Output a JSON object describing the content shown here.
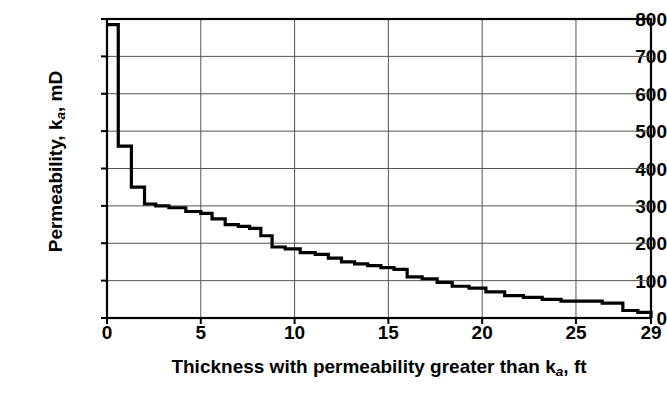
{
  "chart_data": {
    "type": "line",
    "subtype": "step-post",
    "title": "",
    "xlabel": "Thickness with permeability greater than k_a, ft",
    "xlabel_parts": {
      "pre": "Thickness with permeability greater than k",
      "sub": "a",
      "post": ", ft"
    },
    "ylabel": "Permeability, k_a, mD",
    "ylabel_parts": {
      "pre": "Permeability, k",
      "sub": "a",
      "post": ", mD"
    },
    "xlim": [
      0,
      29
    ],
    "ylim": [
      0,
      800
    ],
    "xticks": [
      0,
      5,
      10,
      15,
      20,
      25,
      29
    ],
    "xticklabels": [
      "0",
      "5",
      "10",
      "15",
      "20",
      "25",
      "29"
    ],
    "yticks": [
      0,
      100,
      200,
      300,
      400,
      500,
      600,
      700,
      800
    ],
    "yticklabels": [
      "0",
      "100",
      "200",
      "300",
      "400",
      "500",
      "600",
      "700",
      "800"
    ],
    "grid": true,
    "grid_x_at": [
      5,
      10,
      15,
      20,
      25
    ],
    "grid_y_at": [
      100,
      200,
      300,
      400,
      500,
      600,
      700
    ],
    "legend": null,
    "line_color": "#000000",
    "line_width": 3.2,
    "axis_color": "#000000",
    "grid_color": "#555555",
    "background": "#ffffff",
    "x": [
      0.0,
      0.6,
      1.3,
      2.0,
      2.6,
      3.3,
      4.2,
      5.0,
      5.6,
      6.3,
      7.0,
      7.6,
      8.2,
      8.8,
      9.5,
      10.3,
      11.1,
      11.8,
      12.5,
      13.2,
      13.9,
      14.6,
      15.3,
      16.0,
      16.8,
      17.6,
      18.4,
      19.3,
      20.2,
      21.2,
      22.2,
      23.2,
      24.2,
      25.3,
      26.4,
      27.5,
      28.3,
      29.0
    ],
    "y": [
      785,
      460,
      350,
      305,
      300,
      295,
      285,
      280,
      265,
      250,
      245,
      240,
      220,
      190,
      185,
      175,
      170,
      160,
      150,
      145,
      140,
      135,
      130,
      110,
      105,
      95,
      85,
      80,
      70,
      60,
      55,
      50,
      45,
      45,
      40,
      20,
      15,
      0
    ],
    "steps": [
      {
        "x_start": 0.0,
        "x_end": 0.6,
        "k": 785
      },
      {
        "x_start": 0.6,
        "x_end": 1.3,
        "k": 460
      },
      {
        "x_start": 1.3,
        "x_end": 2.0,
        "k": 350
      },
      {
        "x_start": 2.0,
        "x_end": 2.6,
        "k": 305
      },
      {
        "x_start": 2.6,
        "x_end": 3.3,
        "k": 300
      },
      {
        "x_start": 3.3,
        "x_end": 4.2,
        "k": 295
      },
      {
        "x_start": 4.2,
        "x_end": 5.0,
        "k": 285
      },
      {
        "x_start": 5.0,
        "x_end": 5.6,
        "k": 280
      },
      {
        "x_start": 5.6,
        "x_end": 6.3,
        "k": 265
      },
      {
        "x_start": 6.3,
        "x_end": 7.0,
        "k": 250
      },
      {
        "x_start": 7.0,
        "x_end": 7.6,
        "k": 245
      },
      {
        "x_start": 7.6,
        "x_end": 8.2,
        "k": 240
      },
      {
        "x_start": 8.2,
        "x_end": 8.8,
        "k": 220
      },
      {
        "x_start": 8.8,
        "x_end": 9.5,
        "k": 190
      },
      {
        "x_start": 9.5,
        "x_end": 10.3,
        "k": 185
      },
      {
        "x_start": 10.3,
        "x_end": 11.1,
        "k": 175
      },
      {
        "x_start": 11.1,
        "x_end": 11.8,
        "k": 170
      },
      {
        "x_start": 11.8,
        "x_end": 12.5,
        "k": 160
      },
      {
        "x_start": 12.5,
        "x_end": 13.2,
        "k": 150
      },
      {
        "x_start": 13.2,
        "x_end": 13.9,
        "k": 145
      },
      {
        "x_start": 13.9,
        "x_end": 14.6,
        "k": 140
      },
      {
        "x_start": 14.6,
        "x_end": 15.3,
        "k": 135
      },
      {
        "x_start": 15.3,
        "x_end": 16.0,
        "k": 130
      },
      {
        "x_start": 16.0,
        "x_end": 16.8,
        "k": 110
      },
      {
        "x_start": 16.8,
        "x_end": 17.6,
        "k": 105
      },
      {
        "x_start": 17.6,
        "x_end": 18.4,
        "k": 95
      },
      {
        "x_start": 18.4,
        "x_end": 19.3,
        "k": 85
      },
      {
        "x_start": 19.3,
        "x_end": 20.2,
        "k": 80
      },
      {
        "x_start": 20.2,
        "x_end": 21.2,
        "k": 70
      },
      {
        "x_start": 21.2,
        "x_end": 22.2,
        "k": 60
      },
      {
        "x_start": 22.2,
        "x_end": 23.2,
        "k": 55
      },
      {
        "x_start": 23.2,
        "x_end": 24.2,
        "k": 50
      },
      {
        "x_start": 24.2,
        "x_end": 25.3,
        "k": 45
      },
      {
        "x_start": 25.3,
        "x_end": 26.4,
        "k": 45
      },
      {
        "x_start": 26.4,
        "x_end": 27.5,
        "k": 40
      },
      {
        "x_start": 27.5,
        "x_end": 28.3,
        "k": 20
      },
      {
        "x_start": 28.3,
        "x_end": 29.0,
        "k": 15
      }
    ]
  }
}
